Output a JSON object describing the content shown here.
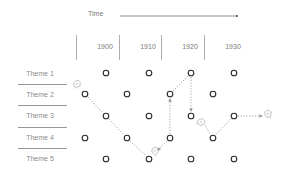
{
  "header": {
    "time_label": "Time"
  },
  "years": [
    "1900",
    "1910",
    "1920",
    "1930"
  ],
  "themes": [
    "Theme 1",
    "Theme 2",
    "Theme 3",
    "Theme 4",
    "Theme 5"
  ],
  "grid": {
    "row_y": [
      73,
      94,
      116,
      138,
      159
    ],
    "odd_row_x": [
      106,
      149,
      191,
      234
    ],
    "even_row_x": [
      85,
      127,
      170,
      213
    ]
  },
  "path": {
    "description": "Dotted trajectory traced by snail icons across themes over time",
    "nodes": [
      {
        "theme": "Theme 2",
        "x": 85,
        "y": 94
      },
      {
        "theme": "Theme 3",
        "x": 106,
        "y": 116
      },
      {
        "theme": "Theme 4",
        "x": 127,
        "y": 138
      },
      {
        "theme": "Theme 5",
        "x": 149,
        "y": 159
      },
      {
        "theme": "Theme 4",
        "x": 170,
        "y": 138
      },
      {
        "theme": "Theme 2",
        "x": 170,
        "y": 94
      },
      {
        "theme": "Theme 1",
        "x": 191,
        "y": 73
      },
      {
        "theme": "Theme 3",
        "x": 191,
        "y": 116
      },
      {
        "theme": "Theme 4",
        "x": 213,
        "y": 138
      },
      {
        "theme": "Theme 3",
        "x": 234,
        "y": 116
      }
    ],
    "snail_icons": [
      {
        "x": 76,
        "y": 83
      },
      {
        "x": 154,
        "y": 150
      },
      {
        "x": 201,
        "y": 121
      },
      {
        "x": 268,
        "y": 113
      }
    ]
  },
  "colors": {
    "circle_stroke": "#2a2a2a",
    "dotted_path": "#9a9a9a",
    "divider": "#7a7a7a",
    "text": "#7a7a7a"
  }
}
